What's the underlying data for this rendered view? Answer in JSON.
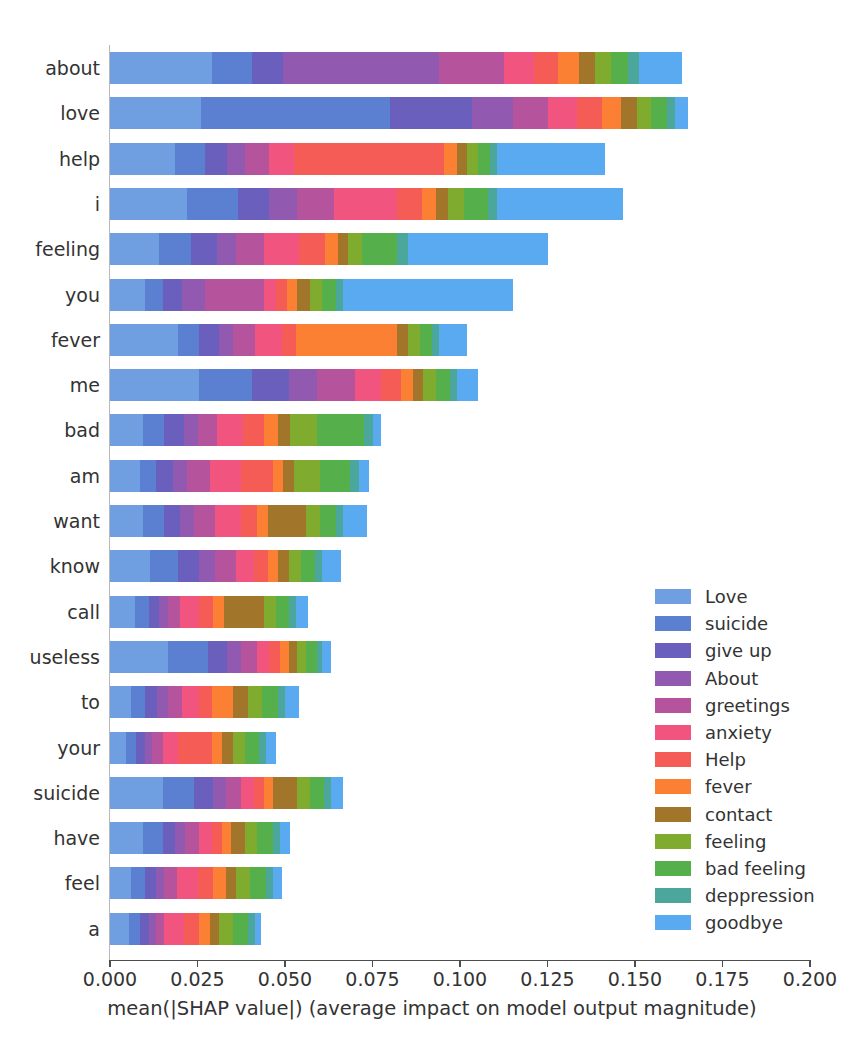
{
  "chart_data": {
    "type": "bar",
    "orientation": "horizontal",
    "stacked": true,
    "title": "",
    "xlabel": "mean(|SHAP value|) (average impact on model output magnitude)",
    "ylabel": "",
    "xlim": [
      0.0,
      0.2
    ],
    "xticks": [
      0.0,
      0.025,
      0.05,
      0.075,
      0.1,
      0.125,
      0.15,
      0.175,
      0.2
    ],
    "xticklabels": [
      "0.000",
      "0.025",
      "0.050",
      "0.075",
      "0.100",
      "0.125",
      "0.150",
      "0.175",
      "0.200"
    ],
    "grid": false,
    "legend_position": "center right",
    "categories": [
      "about",
      "love",
      "help",
      "i",
      "feeling",
      "you",
      "fever",
      "me",
      "bad",
      "am",
      "want",
      "know",
      "call",
      "useless",
      "to",
      "your",
      "suicide",
      "have",
      "feel",
      "a"
    ],
    "series": [
      {
        "name": "Love",
        "color": "#6f9fe0",
        "values": [
          0.029,
          0.026,
          0.0185,
          0.022,
          0.014,
          0.01,
          0.0195,
          0.0255,
          0.0095,
          0.0085,
          0.0095,
          0.0115,
          0.007,
          0.0165,
          0.006,
          0.0045,
          0.015,
          0.0095,
          0.006,
          0.0055
        ]
      },
      {
        "name": "suicide",
        "color": "#5b7fd1",
        "values": [
          0.0115,
          0.054,
          0.0085,
          0.0145,
          0.009,
          0.005,
          0.006,
          0.015,
          0.006,
          0.0045,
          0.006,
          0.008,
          0.004,
          0.0115,
          0.004,
          0.003,
          0.009,
          0.0055,
          0.004,
          0.003
        ]
      },
      {
        "name": "give up",
        "color": "#6a5fbd",
        "values": [
          0.009,
          0.0235,
          0.0065,
          0.009,
          0.0075,
          0.0055,
          0.0055,
          0.0105,
          0.0055,
          0.005,
          0.0045,
          0.006,
          0.003,
          0.0055,
          0.0035,
          0.0025,
          0.0055,
          0.0035,
          0.003,
          0.0025
        ]
      },
      {
        "name": "About",
        "color": "#9159b0",
        "values": [
          0.0445,
          0.0115,
          0.005,
          0.008,
          0.0055,
          0.0065,
          0.004,
          0.008,
          0.004,
          0.004,
          0.004,
          0.0045,
          0.0025,
          0.004,
          0.003,
          0.002,
          0.0035,
          0.003,
          0.0025,
          0.002
        ]
      },
      {
        "name": "greetings",
        "color": "#b5539c",
        "values": [
          0.0185,
          0.01,
          0.007,
          0.0105,
          0.008,
          0.017,
          0.0065,
          0.011,
          0.0055,
          0.0065,
          0.006,
          0.006,
          0.0035,
          0.0045,
          0.004,
          0.003,
          0.0045,
          0.004,
          0.0035,
          0.0025
        ]
      },
      {
        "name": "anxiety",
        "color": "#f0547f",
        "values": [
          0.0085,
          0.0085,
          0.007,
          0.018,
          0.01,
          0.0035,
          0.0075,
          0.0075,
          0.0075,
          0.009,
          0.0075,
          0.005,
          0.0055,
          0.0035,
          0.005,
          0.0045,
          0.0035,
          0.0035,
          0.006,
          0.0055
        ]
      },
      {
        "name": "Help",
        "color": "#f55c55",
        "values": [
          0.007,
          0.007,
          0.043,
          0.007,
          0.0075,
          0.003,
          0.004,
          0.0055,
          0.006,
          0.009,
          0.0045,
          0.004,
          0.004,
          0.003,
          0.0035,
          0.0095,
          0.003,
          0.003,
          0.0045,
          0.0045
        ]
      },
      {
        "name": "fever",
        "color": "#fb8033",
        "values": [
          0.006,
          0.0055,
          0.0035,
          0.004,
          0.0035,
          0.003,
          0.029,
          0.0035,
          0.004,
          0.003,
          0.003,
          0.003,
          0.003,
          0.0025,
          0.006,
          0.003,
          0.0025,
          0.0025,
          0.0035,
          0.003
        ]
      },
      {
        "name": "contact",
        "color": "#a2762a",
        "values": [
          0.0045,
          0.0045,
          0.003,
          0.0035,
          0.003,
          0.0035,
          0.003,
          0.003,
          0.0035,
          0.003,
          0.011,
          0.003,
          0.0115,
          0.0025,
          0.0045,
          0.003,
          0.007,
          0.004,
          0.003,
          0.0025
        ]
      },
      {
        "name": "feeling",
        "color": "#7fab2e",
        "values": [
          0.0045,
          0.004,
          0.003,
          0.0045,
          0.004,
          0.0035,
          0.0035,
          0.0035,
          0.0075,
          0.0075,
          0.004,
          0.0035,
          0.0035,
          0.0025,
          0.004,
          0.0035,
          0.0035,
          0.0035,
          0.004,
          0.004
        ]
      },
      {
        "name": "bad feeling",
        "color": "#55b04c",
        "values": [
          0.005,
          0.0045,
          0.0035,
          0.007,
          0.01,
          0.004,
          0.0035,
          0.004,
          0.0135,
          0.0085,
          0.0045,
          0.004,
          0.0035,
          0.003,
          0.0045,
          0.004,
          0.004,
          0.0045,
          0.0045,
          0.0045
        ]
      },
      {
        "name": "deppression",
        "color": "#4ba79b",
        "values": [
          0.003,
          0.0025,
          0.002,
          0.0025,
          0.003,
          0.002,
          0.002,
          0.002,
          0.0025,
          0.0025,
          0.002,
          0.002,
          0.002,
          0.0015,
          0.002,
          0.002,
          0.002,
          0.002,
          0.002,
          0.002
        ]
      },
      {
        "name": "goodbye",
        "color": "#5aaaf2",
        "values": [
          0.0125,
          0.0035,
          0.031,
          0.036,
          0.04,
          0.0485,
          0.008,
          0.006,
          0.0025,
          0.003,
          0.007,
          0.0055,
          0.0035,
          0.0025,
          0.004,
          0.003,
          0.0035,
          0.003,
          0.0025,
          0.0015
        ]
      }
    ],
    "totals": [
      0.196,
      0.1845,
      0.15,
      0.147,
      0.125,
      0.115,
      0.096,
      0.096,
      0.073,
      0.07,
      0.0645,
      0.0575,
      0.055,
      0.052,
      0.0455,
      0.041,
      0.041,
      0.039,
      0.0385,
      0.038
    ]
  },
  "caption": "",
  "axis": {
    "title": "mean(|SHAP value|) (average impact on model output magnitude)"
  }
}
